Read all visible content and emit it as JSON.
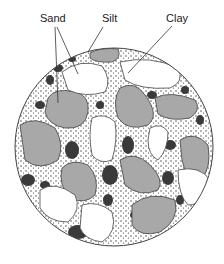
{
  "diagram": {
    "labels": {
      "sand": "Sand",
      "silt": "Silt",
      "clay": "Clay"
    },
    "colors": {
      "sand_shaded": "#a8a8a8",
      "sand_white": "#ffffff",
      "silt": "#3a3a3a",
      "outline": "#333333",
      "background": "#ffffff"
    }
  }
}
